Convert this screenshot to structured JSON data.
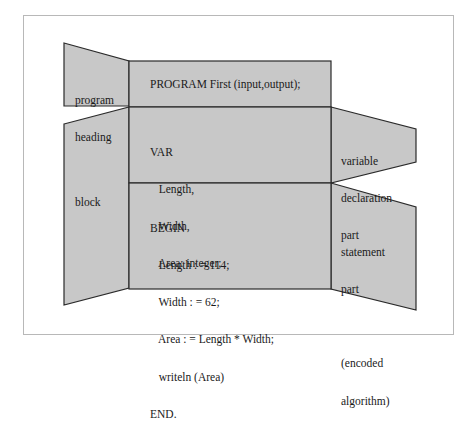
{
  "diagram": {
    "labels": {
      "program_heading": [
        "program",
        "heading"
      ],
      "block": "block",
      "variable_declaration_part": [
        "variable",
        "declaration",
        "part"
      ],
      "statement_part": [
        "statement",
        "part",
        "",
        "(encoded",
        "algorithm)"
      ]
    },
    "code": {
      "heading": "PROGRAM First (input,output);",
      "declarations": [
        "VAR",
        "   Length,",
        "   Width,",
        "   Area: integer;"
      ],
      "statements": [
        "BEGIN",
        "   Length : = 114;",
        "   Width : = 62;",
        "   Area : = Length * Width;",
        "   writeln (Area)",
        "END."
      ]
    },
    "colors": {
      "panel_fill": "#c8c8c8",
      "outline": "#2a2a2a",
      "frame": "#b8b8b8"
    }
  }
}
